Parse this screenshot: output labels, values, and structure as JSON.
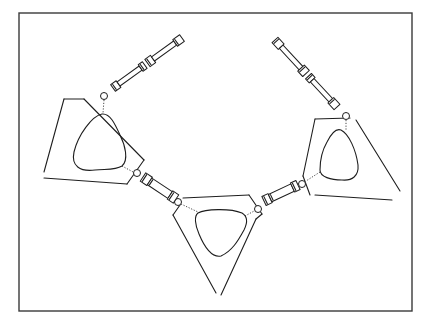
{
  "figure": {
    "title": "",
    "colors": {
      "ink": "#1e1e1e",
      "frame": "#3a3a3a",
      "background": "#ffffff"
    },
    "frame": {
      "x": 19,
      "y": 13,
      "width": 393,
      "height": 298
    },
    "pendants": [
      {
        "name": "left",
        "outer": "M64,99 L83,99 L143,160 L127,183 M124,183 L44,178 M44,172 L64,99",
        "outer_lines": [
          [
            64,
            99,
            84,
            99
          ],
          [
            84,
            99,
            144,
            160
          ],
          [
            144,
            160,
            127,
            184
          ],
          [
            127,
            184,
            44,
            178
          ],
          [
            44,
            172,
            64,
            99
          ]
        ],
        "inner": "M102,114 C92,116 78,135 74,152 C71,166 80,172 95,170 C108,169 116,170 122,166 C129,160 125,145 120,135 C115,124 110,113 102,114 Z",
        "ring": {
          "cx": 104,
          "cy": 96,
          "r": 3.5
        },
        "dots": [
          [
            104,
            100,
            103,
            113
          ],
          [
            122,
            166,
            135,
            173
          ]
        ]
      },
      {
        "name": "center",
        "outer": "M180,199 L249,195 L262,216 L257,216 L222,294 M216,294 L173,215 L178,212 Z",
        "outer_lines": [
          [
            183,
            198,
            249,
            195
          ],
          [
            249,
            195,
            262,
            214
          ],
          [
            262,
            214,
            256,
            219
          ],
          [
            256,
            219,
            221,
            295
          ],
          [
            216,
            293,
            173,
            215
          ],
          [
            173,
            215,
            180,
            205
          ]
        ],
        "inner": "M198,213 C205,209 230,208 242,213 C247,216 248,222 244,230 C238,241 232,251 221,256 C211,258 204,246 199,234 C195,225 194,216 198,213 Z",
        "ring_left": {
          "cx": 178,
          "cy": 202,
          "r": 3.5
        },
        "ring_right": {
          "cx": 258,
          "cy": 209,
          "r": 3.5
        },
        "dots": [
          [
            181,
            204,
            198,
            212
          ],
          [
            245,
            216,
            256,
            210
          ]
        ]
      },
      {
        "name": "right",
        "outer": "M306,124 L323,119 M320,119 L346,119 L400,190 M392,200 L318,195 L303,176 L310,170 Z",
        "outer_lines": [
          [
            315,
            119,
            350,
            118
          ],
          [
            356,
            120,
            400,
            191
          ],
          [
            392,
            200,
            315,
            195
          ],
          [
            310,
            195,
            303,
            176
          ],
          [
            303,
            176,
            315,
            119
          ]
        ],
        "inner": "M341,130 C349,134 356,150 358,165 C359,176 352,181 342,180 C331,180 320,177 320,170 C320,160 323,149 327,142 C331,134 336,128 341,130 Z",
        "ring": {
          "cx": 346,
          "cy": 116,
          "r": 3.5
        },
        "dots": [
          [
            346,
            120,
            346,
            130
          ],
          [
            320,
            172,
            306,
            181
          ]
        ]
      }
    ],
    "clasps": [
      {
        "name": "left-long-clasp",
        "from": [
          113,
          88
        ],
        "to": [
          182,
          38
        ],
        "segments": [
          {
            "t0": 0.0,
            "t1": 0.08,
            "w": 8
          },
          {
            "t0": 0.08,
            "t1": 0.4,
            "w": 5
          },
          {
            "t0": 0.4,
            "t1": 0.46,
            "w": 8
          },
          {
            "t0": 0.5,
            "t1": 0.58,
            "w": 9
          },
          {
            "t0": 0.58,
            "t1": 0.9,
            "w": 5
          },
          {
            "t0": 0.9,
            "t1": 1.0,
            "w": 8
          }
        ]
      },
      {
        "name": "right-long-clasp",
        "from": [
          275,
          40
        ],
        "to": [
          337,
          107
        ],
        "segments": [
          {
            "t0": 0.0,
            "t1": 0.1,
            "w": 8
          },
          {
            "t0": 0.1,
            "t1": 0.42,
            "w": 5
          },
          {
            "t0": 0.42,
            "t1": 0.5,
            "w": 9
          },
          {
            "t0": 0.54,
            "t1": 0.6,
            "w": 8
          },
          {
            "t0": 0.6,
            "t1": 0.9,
            "w": 5
          },
          {
            "t0": 0.9,
            "t1": 1.0,
            "w": 8
          }
        ]
      },
      {
        "name": "left-short-clasp",
        "from": [
          143,
          177
        ],
        "to": [
          176,
          199
        ],
        "segments": [
          {
            "t0": 0.0,
            "t1": 0.2,
            "w": 10
          },
          {
            "t0": 0.2,
            "t1": 0.82,
            "w": 8
          },
          {
            "t0": 0.82,
            "t1": 1.0,
            "w": 10
          }
        ]
      },
      {
        "name": "right-short-clasp",
        "from": [
          264,
          201
        ],
        "to": [
          298,
          185
        ],
        "segments": [
          {
            "t0": 0.0,
            "t1": 0.18,
            "w": 10
          },
          {
            "t0": 0.18,
            "t1": 0.84,
            "w": 8
          },
          {
            "t0": 0.84,
            "t1": 1.0,
            "w": 10
          }
        ]
      }
    ],
    "jump_rings": [
      {
        "name": "left-short-clasp-ring",
        "cx": 137,
        "cy": 173,
        "r": 3.5
      },
      {
        "name": "right-short-clasp-ring",
        "cx": 302,
        "cy": 184,
        "r": 3.5
      }
    ]
  }
}
